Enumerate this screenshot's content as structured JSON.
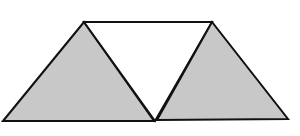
{
  "diagram": {
    "colors": {
      "shade": "#c8c8c8",
      "stroke": "#111111",
      "background": "#ffffff"
    },
    "shapes": [
      {
        "name": "left-triangle",
        "fill": "shaded",
        "points": "3,121 84,22 154,121"
      },
      {
        "name": "middle-triangle",
        "fill": "white",
        "points": "84,22 212,22 155,121"
      },
      {
        "name": "right-triangle",
        "fill": "shaded",
        "points": "157,120 212,22 288,119"
      }
    ]
  }
}
